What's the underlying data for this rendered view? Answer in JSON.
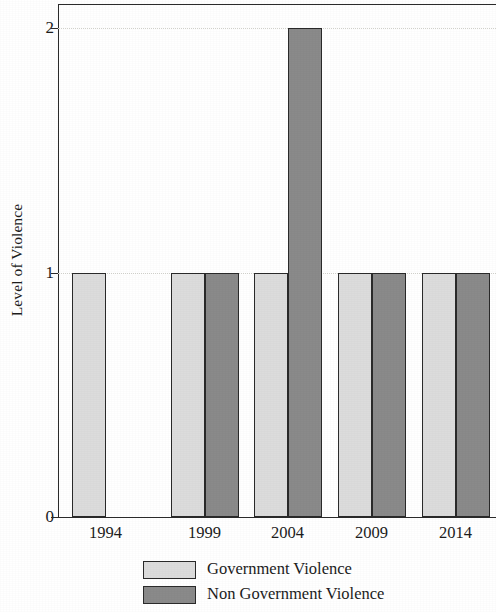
{
  "chart_data": {
    "type": "bar",
    "title": "",
    "subtitle": "",
    "xlabel": "",
    "ylabel": "Level of Violence",
    "categories": [
      "1994",
      "1999",
      "2004",
      "2009",
      "2014"
    ],
    "series": [
      {
        "name": "Government Violence",
        "color": "#dcdcdc",
        "values": [
          1,
          1,
          1,
          1,
          1
        ]
      },
      {
        "name": "Non Government Violence",
        "color": "#8a8a8a",
        "values": [
          0,
          1,
          2,
          1,
          1
        ]
      }
    ],
    "ylim": [
      0,
      2.1
    ],
    "yticks": [
      0,
      1,
      2
    ],
    "ytick_labels": [
      "0",
      "1",
      "2"
    ],
    "xtick_labels": [
      "1994",
      "1999",
      "2004",
      "2009",
      "2014"
    ],
    "grid": "horizontal-dotted",
    "legend_position": "below-axis-left",
    "frame": "top-and-left-spines"
  },
  "axes": {
    "y_title": "Level of Violence",
    "y_ticks": [
      {
        "label": "2",
        "value": 2
      },
      {
        "label": "1",
        "value": 1
      },
      {
        "label": "0",
        "value": 0
      }
    ],
    "x_ticks": [
      {
        "label": "1994"
      },
      {
        "label": "1999"
      },
      {
        "label": "2004"
      },
      {
        "label": "2009"
      },
      {
        "label": "2014"
      }
    ]
  },
  "legend": {
    "entries": [
      {
        "label": "Government Violence",
        "color": "#dcdcdc"
      },
      {
        "label": "Non Government Violence",
        "color": "#8a8a8a"
      }
    ]
  },
  "colors": {
    "government_violence": "#dcdcdc",
    "non_government_violence": "#8a8a8a",
    "axis": "#2b2b2b",
    "gridline": "#d2d2cc",
    "background": "#ffffff",
    "text": "#1c1c1c"
  }
}
